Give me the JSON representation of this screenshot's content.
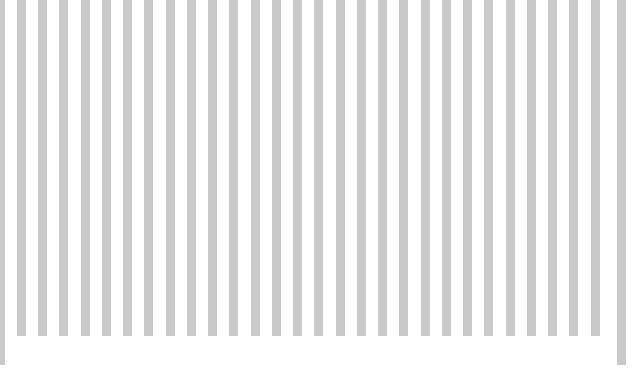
{
  "figure": {
    "background_color": "#ffffff",
    "bar_color": "#c9c9c9",
    "width_px": 638,
    "height_px": 381,
    "title": "",
    "subtitle": "",
    "note": ""
  },
  "chart_data": {
    "type": "bar",
    "title": "",
    "xlabel": "",
    "ylabel": "",
    "grid": false,
    "legend": null,
    "legend_position": "none",
    "orientation": "vertical",
    "clipped_top": true,
    "baseline_y_px": 336,
    "bar_color": "#c9c9c9",
    "bar_width_px": 9,
    "bar_pitch_px": 21.3,
    "xlim": [
      0,
      638
    ],
    "ylim": [
      0,
      381
    ],
    "tick_labels_x": [],
    "tick_labels_y": [],
    "categories": [
      "1",
      "2",
      "3",
      "4",
      "5",
      "6",
      "7",
      "8",
      "9",
      "10",
      "11",
      "12",
      "13",
      "14",
      "15",
      "16",
      "17",
      "18",
      "19",
      "20",
      "21",
      "22",
      "23",
      "24",
      "25",
      "26",
      "27",
      "28",
      "29",
      "30"
    ],
    "values": [
      365,
      336,
      336,
      336,
      336,
      336,
      336,
      336,
      336,
      336,
      336,
      336,
      336,
      336,
      336,
      336,
      336,
      336,
      336,
      336,
      336,
      336,
      336,
      336,
      336,
      336,
      336,
      336,
      336,
      365
    ],
    "bars": [
      {
        "name": "bar-1",
        "x_px": 0,
        "width_px": 5,
        "bottom_y_px": 365,
        "role": "axis-spine"
      },
      {
        "name": "bar-2",
        "x_px": 17,
        "width_px": 9,
        "bottom_y_px": 336,
        "role": "bar"
      },
      {
        "name": "bar-3",
        "x_px": 38,
        "width_px": 9,
        "bottom_y_px": 336,
        "role": "bar"
      },
      {
        "name": "bar-4",
        "x_px": 59,
        "width_px": 9,
        "bottom_y_px": 336,
        "role": "bar"
      },
      {
        "name": "bar-5",
        "x_px": 81,
        "width_px": 9,
        "bottom_y_px": 336,
        "role": "bar"
      },
      {
        "name": "bar-6",
        "x_px": 102,
        "width_px": 9,
        "bottom_y_px": 336,
        "role": "bar"
      },
      {
        "name": "bar-7",
        "x_px": 123,
        "width_px": 9,
        "bottom_y_px": 336,
        "role": "bar"
      },
      {
        "name": "bar-8",
        "x_px": 144,
        "width_px": 9,
        "bottom_y_px": 336,
        "role": "bar"
      },
      {
        "name": "bar-9",
        "x_px": 166,
        "width_px": 9,
        "bottom_y_px": 336,
        "role": "bar"
      },
      {
        "name": "bar-10",
        "x_px": 187,
        "width_px": 9,
        "bottom_y_px": 336,
        "role": "bar"
      },
      {
        "name": "bar-11",
        "x_px": 208,
        "width_px": 9,
        "bottom_y_px": 336,
        "role": "bar"
      },
      {
        "name": "bar-12",
        "x_px": 229,
        "width_px": 9,
        "bottom_y_px": 336,
        "role": "bar"
      },
      {
        "name": "bar-13",
        "x_px": 251,
        "width_px": 9,
        "bottom_y_px": 336,
        "role": "bar"
      },
      {
        "name": "bar-14",
        "x_px": 272,
        "width_px": 9,
        "bottom_y_px": 336,
        "role": "bar"
      },
      {
        "name": "bar-15",
        "x_px": 293,
        "width_px": 9,
        "bottom_y_px": 336,
        "role": "bar"
      },
      {
        "name": "bar-16",
        "x_px": 314,
        "width_px": 9,
        "bottom_y_px": 336,
        "role": "bar"
      },
      {
        "name": "bar-17",
        "x_px": 336,
        "width_px": 9,
        "bottom_y_px": 336,
        "role": "bar"
      },
      {
        "name": "bar-18",
        "x_px": 357,
        "width_px": 9,
        "bottom_y_px": 336,
        "role": "bar"
      },
      {
        "name": "bar-19",
        "x_px": 378,
        "width_px": 9,
        "bottom_y_px": 336,
        "role": "bar"
      },
      {
        "name": "bar-20",
        "x_px": 399,
        "width_px": 9,
        "bottom_y_px": 336,
        "role": "bar"
      },
      {
        "name": "bar-21",
        "x_px": 421,
        "width_px": 9,
        "bottom_y_px": 336,
        "role": "bar"
      },
      {
        "name": "bar-22",
        "x_px": 442,
        "width_px": 9,
        "bottom_y_px": 336,
        "role": "bar"
      },
      {
        "name": "bar-23",
        "x_px": 463,
        "width_px": 9,
        "bottom_y_px": 336,
        "role": "bar"
      },
      {
        "name": "bar-24",
        "x_px": 484,
        "width_px": 9,
        "bottom_y_px": 336,
        "role": "bar"
      },
      {
        "name": "bar-25",
        "x_px": 506,
        "width_px": 9,
        "bottom_y_px": 336,
        "role": "bar"
      },
      {
        "name": "bar-26",
        "x_px": 527,
        "width_px": 9,
        "bottom_y_px": 336,
        "role": "bar"
      },
      {
        "name": "bar-27",
        "x_px": 548,
        "width_px": 9,
        "bottom_y_px": 336,
        "role": "bar"
      },
      {
        "name": "bar-28",
        "x_px": 569,
        "width_px": 9,
        "bottom_y_px": 336,
        "role": "bar"
      },
      {
        "name": "bar-29",
        "x_px": 591,
        "width_px": 9,
        "bottom_y_px": 336,
        "role": "bar"
      },
      {
        "name": "bar-30",
        "x_px": 617,
        "width_px": 9,
        "bottom_y_px": 365,
        "role": "axis-spine"
      }
    ]
  }
}
